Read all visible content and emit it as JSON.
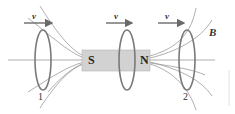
{
  "diagram": {
    "magnet": {
      "south_label": "S",
      "north_label": "N",
      "fill": "#cfcfcf"
    },
    "velocity_labels": [
      "v",
      "v",
      "v"
    ],
    "field_label": "B",
    "loops": [
      {
        "id": "loop-1",
        "label": "1"
      },
      {
        "id": "loop-middle",
        "label": ""
      },
      {
        "id": "loop-2",
        "label": "2"
      }
    ],
    "colors": {
      "loop": "#7a7a7a",
      "field_line": "#9a9a9a",
      "arrow": "#6a6a6a"
    }
  }
}
